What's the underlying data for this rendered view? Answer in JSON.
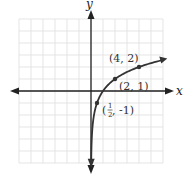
{
  "chart_data": {
    "type": "line",
    "title": "",
    "function": "y = log2(x)",
    "xlabel": "x",
    "ylabel": "y",
    "xlim": [
      -6,
      6
    ],
    "ylim": [
      -6,
      6
    ],
    "grid": true,
    "points": [
      {
        "x": 0.5,
        "y": -1,
        "label": "(1/2, -1)"
      },
      {
        "x": 2,
        "y": 1,
        "label": "(2, 1)"
      },
      {
        "x": 4,
        "y": 2,
        "label": "(4, 2)"
      }
    ],
    "series": [
      {
        "name": "y = log2(x)",
        "x": [
          0.02,
          0.05,
          0.1,
          0.25,
          0.5,
          1,
          2,
          3,
          4,
          5.5
        ],
        "values": [
          -5.64,
          -4.32,
          -3.32,
          -2,
          -1,
          0,
          1,
          1.58,
          2,
          2.46
        ]
      }
    ]
  },
  "labels": {
    "x_axis": "x",
    "y_axis": "y",
    "p1_pre": "(",
    "p1_num": "1",
    "p1_den": "2",
    "p1_post": ", -1)",
    "p2": "(2, 1)",
    "p3": "(4, 2)"
  },
  "colors": {
    "axis": "#222222",
    "grid": "#dddddd",
    "curve": "#333333"
  }
}
